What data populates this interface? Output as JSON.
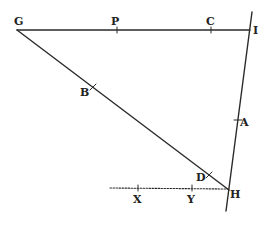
{
  "diagram": {
    "type": "geometric-construction",
    "colors": {
      "ink": "#2a2a2a",
      "background": "#ffffff"
    },
    "points": {
      "G": {
        "label": "G",
        "x": 17,
        "y": 30
      },
      "P": {
        "label": "P",
        "x": 117,
        "y": 30
      },
      "C": {
        "label": "C",
        "x": 211,
        "y": 30
      },
      "I": {
        "label": "I",
        "x": 249,
        "y": 30
      },
      "B": {
        "label": "B",
        "x": 93,
        "y": 87
      },
      "A": {
        "label": "A",
        "x": 238,
        "y": 120
      },
      "D": {
        "label": "D",
        "x": 209,
        "y": 175
      },
      "H": {
        "label": "H",
        "x": 228,
        "y": 189
      },
      "X": {
        "label": "X",
        "x": 138,
        "y": 188
      },
      "Y": {
        "label": "Y",
        "x": 192,
        "y": 188
      }
    },
    "lines": [
      {
        "name": "line-GI",
        "from": "G",
        "to": "I",
        "style": "solid"
      },
      {
        "name": "line-GH",
        "from": "G",
        "to": "H",
        "style": "solid"
      },
      {
        "name": "line-IH-extended",
        "from": "I",
        "to": "H",
        "style": "solid",
        "extended": true
      },
      {
        "name": "line-XH",
        "from": "X",
        "to": "H",
        "style": "dotted"
      }
    ]
  }
}
